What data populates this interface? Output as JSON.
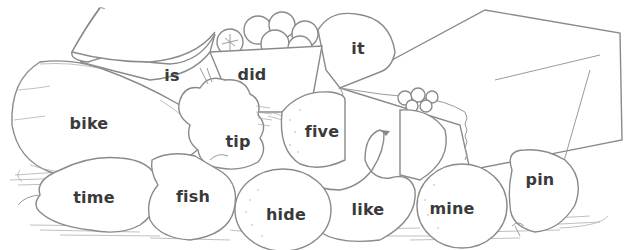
{
  "worksheet": {
    "description": "Line drawing of a pile of fruit, a berry basket and a paper bag; each fruit labeled with a short word",
    "ink_color": "#3a3a3a",
    "line_color": "#8a8a8a",
    "words": [
      {
        "id": "is",
        "text": "is",
        "object": "banana",
        "x": 172,
        "y": 75
      },
      {
        "id": "did",
        "text": "did",
        "object": "berry-basket",
        "x": 252,
        "y": 74
      },
      {
        "id": "it",
        "text": "it",
        "object": "orange",
        "x": 358,
        "y": 48
      },
      {
        "id": "bike",
        "text": "bike",
        "object": "squash",
        "x": 89,
        "y": 123
      },
      {
        "id": "tip",
        "text": "tip",
        "object": "grapes",
        "x": 238,
        "y": 141
      },
      {
        "id": "five",
        "text": "five",
        "object": "orange",
        "x": 322,
        "y": 131
      },
      {
        "id": "time",
        "text": "time",
        "object": "pear",
        "x": 94,
        "y": 197
      },
      {
        "id": "fish",
        "text": "fish",
        "object": "pear",
        "x": 193,
        "y": 196
      },
      {
        "id": "hide",
        "text": "hide",
        "object": "orange",
        "x": 286,
        "y": 214
      },
      {
        "id": "like",
        "text": "like",
        "object": "banana",
        "x": 368,
        "y": 209
      },
      {
        "id": "mine",
        "text": "mine",
        "object": "orange",
        "x": 452,
        "y": 208
      },
      {
        "id": "pin",
        "text": "pin",
        "object": "pear",
        "x": 540,
        "y": 179
      }
    ]
  }
}
